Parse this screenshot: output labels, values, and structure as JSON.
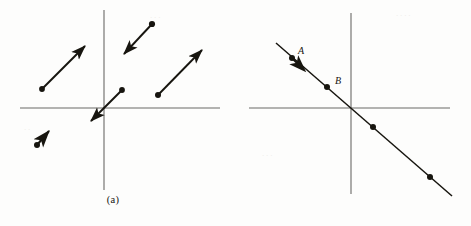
{
  "figure": {
    "width": 471,
    "height": 226,
    "background_color": "#fdfdfc",
    "ink_color": "#17150f",
    "axis_color": "#6b6a66",
    "type": "mathematical-diagram"
  },
  "panel_a": {
    "caption": "(a)",
    "axes": {
      "x_axis": {
        "y": 108,
        "x_start": 20,
        "x_end": 220
      },
      "y_axis": {
        "x": 104,
        "y_start": 10,
        "y_end": 190
      },
      "origin": {
        "x": 104,
        "y": 108
      }
    },
    "vectors": [
      {
        "name": "upper-left-vector",
        "tail": {
          "x": 42,
          "y": 89
        },
        "tip": {
          "x": 89,
          "y": 42
        },
        "direction": "up-right"
      },
      {
        "name": "top-middle-vector",
        "tail": {
          "x": 152,
          "y": 24
        },
        "tip": {
          "x": 121,
          "y": 57
        },
        "direction": "down-left"
      },
      {
        "name": "origin-vector",
        "tail": {
          "x": 122,
          "y": 90
        },
        "tip": {
          "x": 88,
          "y": 124
        },
        "direction": "down-left"
      },
      {
        "name": "right-vector",
        "tail": {
          "x": 158,
          "y": 95
        },
        "tip": {
          "x": 206,
          "y": 46
        },
        "direction": "up-right"
      },
      {
        "name": "lower-left-vector",
        "tail": {
          "x": 37,
          "y": 145
        },
        "tip": {
          "x": 53,
          "y": 127
        },
        "direction": "up-right"
      }
    ]
  },
  "panel_b": {
    "caption": "(b)",
    "axes": {
      "x_axis": {
        "y": 108,
        "x_start": 13,
        "x_end": 214
      },
      "y_axis": {
        "x": 115,
        "y_start": 13,
        "y_end": 194
      },
      "origin": {
        "x": 115,
        "y": 108
      }
    },
    "line": {
      "name": "solution-line",
      "start": {
        "x": 40,
        "y": 43
      },
      "end": {
        "x": 216,
        "y": 196
      },
      "slope_sign": "negative"
    },
    "points": [
      {
        "label": "A",
        "x": 56,
        "y": 58,
        "labeled": true
      },
      {
        "label": "B",
        "x": 91,
        "y": 87,
        "labeled": true
      },
      {
        "label": "",
        "x": 137,
        "y": 127,
        "labeled": false
      },
      {
        "label": "",
        "x": 194,
        "y": 177,
        "labeled": false
      }
    ],
    "arrowhead": {
      "x": 62,
      "y": 65,
      "direction": "down-right"
    }
  }
}
